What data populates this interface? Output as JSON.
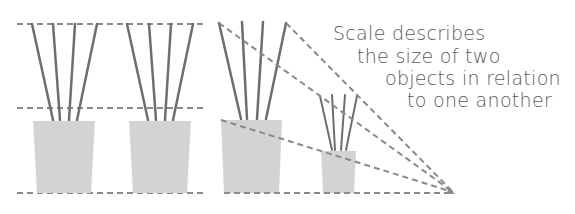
{
  "caption": {
    "lines": [
      "Scale describes",
      "the size of two",
      "objects in relation",
      "to one another"
    ]
  },
  "colors": {
    "pot_fill": "#d3d3d3",
    "stick_stroke": "#6e6e6e",
    "guide_stroke": "#8a8a8a",
    "text": "#5a5a5a",
    "background": "#ffffff"
  },
  "panels": {
    "equal_size": {
      "description": "Two identical pots with reed sticks between three parallel dashed guide lines",
      "guide_lines_y": [
        24,
        108,
        193
      ]
    },
    "perspective": {
      "description": "Large pot and small pot with dashed lines converging to a vanishing point",
      "vanishing_point": [
        453,
        192
      ]
    }
  }
}
